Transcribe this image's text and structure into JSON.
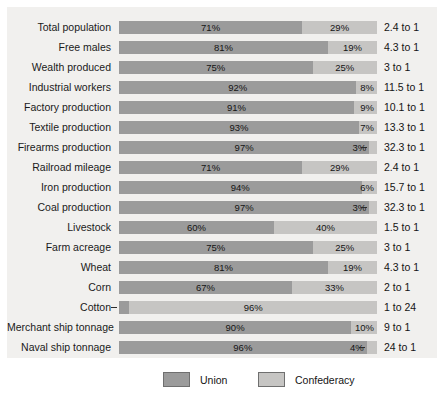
{
  "legend": {
    "union": {
      "label": "Union",
      "color": "#9b9b9b"
    },
    "confederacy": {
      "label": "Confederacy",
      "color": "#c6c5c3"
    }
  },
  "colors": {
    "panel_background": "#f1f0ee",
    "page_background": "#ffffff",
    "union": "#9b9b9b",
    "confederacy": "#c6c5c3",
    "text": "#141414"
  },
  "chart_data": {
    "type": "bar",
    "subtype": "stacked-horizontal-100pct",
    "title": "",
    "subtitle": "",
    "xlabel": "",
    "ylabel": "",
    "xlim": [
      0,
      100
    ],
    "grid": false,
    "legend_position": "bottom",
    "value_unit": "%",
    "categories": [
      "Total population",
      "Free males",
      "Wealth produced",
      "Industrial workers",
      "Factory production",
      "Textile production",
      "Firearms production",
      "Railroad mileage",
      "Iron production",
      "Coal production",
      "Livestock",
      "Farm acreage",
      "Wheat",
      "Corn",
      "Cotton",
      "Merchant ship tonnage",
      "Naval ship tonnage"
    ],
    "series": [
      {
        "name": "Union",
        "color": "#9b9b9b",
        "values": [
          71,
          81,
          75,
          92,
          91,
          93,
          97,
          71,
          94,
          97,
          60,
          75,
          81,
          67,
          4,
          90,
          96
        ]
      },
      {
        "name": "Confederacy",
        "color": "#c6c5c3",
        "values": [
          29,
          19,
          25,
          8,
          9,
          7,
          3,
          29,
          6,
          3,
          40,
          25,
          19,
          33,
          96,
          10,
          4
        ]
      }
    ],
    "annotations": {
      "ratio_column_label": "",
      "ratios": [
        "2.4 to 1",
        "4.3 to 1",
        "3 to 1",
        "11.5 to 1",
        "10.1 to 1",
        "13.3 to 1",
        "32.3 to 1",
        "2.4 to 1",
        "15.7 to 1",
        "32.3 to 1",
        "1.5 to 1",
        "3 to 1",
        "4.3 to 1",
        "2 to 1",
        "1 to 24",
        "9 to 1",
        "24 to 1"
      ]
    }
  },
  "rows": [
    {
      "label": "Total population",
      "union_pct": 71,
      "conf_pct": 29,
      "union_text": "71%",
      "conf_text": "29%",
      "union_placement": "center",
      "conf_placement": "center",
      "union_leader": false,
      "conf_leader": false,
      "ratio": "2.4 to 1"
    },
    {
      "label": "Free males",
      "union_pct": 81,
      "conf_pct": 19,
      "union_text": "81%",
      "conf_text": "19%",
      "union_placement": "center",
      "conf_placement": "center",
      "union_leader": false,
      "conf_leader": false,
      "ratio": "4.3 to 1"
    },
    {
      "label": "Wealth produced",
      "union_pct": 75,
      "conf_pct": 25,
      "union_text": "75%",
      "conf_text": "25%",
      "union_placement": "center",
      "conf_placement": "center",
      "union_leader": false,
      "conf_leader": false,
      "ratio": "3 to 1"
    },
    {
      "label": "Industrial workers",
      "union_pct": 92,
      "conf_pct": 8,
      "union_text": "92%",
      "conf_text": "8%",
      "union_placement": "center",
      "conf_placement": "inright",
      "union_leader": false,
      "conf_leader": false,
      "ratio": "11.5 to 1"
    },
    {
      "label": "Factory production",
      "union_pct": 91,
      "conf_pct": 9,
      "union_text": "91%",
      "conf_text": "9%",
      "union_placement": "center",
      "conf_placement": "inright",
      "union_leader": false,
      "conf_leader": false,
      "ratio": "10.1 to 1"
    },
    {
      "label": "Textile production",
      "union_pct": 93,
      "conf_pct": 7,
      "union_text": "93%",
      "conf_text": "7%",
      "union_placement": "center",
      "conf_placement": "inright",
      "union_leader": false,
      "conf_leader": false,
      "ratio": "13.3 to 1"
    },
    {
      "label": "Firearms production",
      "union_pct": 97,
      "conf_pct": 3,
      "union_text": "97%",
      "conf_text": "3%",
      "union_placement": "center",
      "conf_placement": "outleft",
      "union_leader": false,
      "conf_leader": true,
      "ratio": "32.3 to 1"
    },
    {
      "label": "Railroad mileage",
      "union_pct": 71,
      "conf_pct": 29,
      "union_text": "71%",
      "conf_text": "29%",
      "union_placement": "center",
      "conf_placement": "center",
      "union_leader": false,
      "conf_leader": false,
      "ratio": "2.4 to 1"
    },
    {
      "label": "Iron production",
      "union_pct": 94,
      "conf_pct": 6,
      "union_text": "94%",
      "conf_text": "6%",
      "union_placement": "center",
      "conf_placement": "inright",
      "union_leader": false,
      "conf_leader": false,
      "ratio": "15.7 to 1"
    },
    {
      "label": "Coal production",
      "union_pct": 97,
      "conf_pct": 3,
      "union_text": "97%",
      "conf_text": "3%",
      "union_placement": "center",
      "conf_placement": "outleft",
      "union_leader": false,
      "conf_leader": true,
      "ratio": "32.3 to 1"
    },
    {
      "label": "Livestock",
      "union_pct": 60,
      "conf_pct": 40,
      "union_text": "60%",
      "conf_text": "40%",
      "union_placement": "center",
      "conf_placement": "center",
      "union_leader": false,
      "conf_leader": false,
      "ratio": "1.5 to 1"
    },
    {
      "label": "Farm acreage",
      "union_pct": 75,
      "conf_pct": 25,
      "union_text": "75%",
      "conf_text": "25%",
      "union_placement": "center",
      "conf_placement": "center",
      "union_leader": false,
      "conf_leader": false,
      "ratio": "3 to 1"
    },
    {
      "label": "Wheat",
      "union_pct": 81,
      "conf_pct": 19,
      "union_text": "81%",
      "conf_text": "19%",
      "union_placement": "center",
      "conf_placement": "center",
      "union_leader": false,
      "conf_leader": false,
      "ratio": "4.3 to 1"
    },
    {
      "label": "Corn",
      "union_pct": 67,
      "conf_pct": 33,
      "union_text": "67%",
      "conf_text": "33%",
      "union_placement": "center",
      "conf_placement": "center",
      "union_leader": false,
      "conf_leader": false,
      "ratio": "2 to 1"
    },
    {
      "label": "Cotton",
      "union_pct": 4,
      "conf_pct": 96,
      "union_text": "4%",
      "conf_text": "96%",
      "union_placement": "outright",
      "conf_placement": "center",
      "union_leader": true,
      "conf_leader": false,
      "ratio": "1 to 24"
    },
    {
      "label": "Merchant ship tonnage",
      "union_pct": 90,
      "conf_pct": 10,
      "union_text": "90%",
      "conf_text": "10%",
      "union_placement": "center",
      "conf_placement": "inright",
      "union_leader": false,
      "conf_leader": false,
      "ratio": "9 to 1"
    },
    {
      "label": "Naval ship tonnage",
      "union_pct": 96,
      "conf_pct": 4,
      "union_text": "96%",
      "conf_text": "4%",
      "union_placement": "center",
      "conf_placement": "outleft",
      "union_leader": false,
      "conf_leader": true,
      "ratio": "24 to 1"
    }
  ]
}
